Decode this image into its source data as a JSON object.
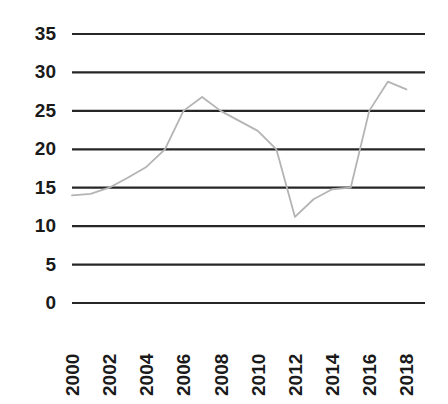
{
  "chart_data": {
    "type": "line",
    "title": "",
    "subtitle": "",
    "xlabel": "",
    "ylabel": "",
    "xlim": [
      2000,
      2019
    ],
    "ylim": [
      0,
      35
    ],
    "grid": "horizontal-only",
    "legend": "none",
    "line_color": "#b4b4b4",
    "grid_color": "#262626",
    "tick_label_color": "#1a1a1a",
    "x": [
      2000,
      2001,
      2002,
      2003,
      2004,
      2005,
      2006,
      2007,
      2008,
      2009,
      2010,
      2011,
      2012,
      2013,
      2014,
      2015,
      2016,
      2017,
      2018
    ],
    "values": [
      14.0,
      14.2,
      15.0,
      16.3,
      17.7,
      20.0,
      25.0,
      26.8,
      25.0,
      23.7,
      22.4,
      20.0,
      11.2,
      13.5,
      14.8,
      15.0,
      25.0,
      28.8,
      27.8
    ],
    "series": [
      {
        "name": "series-1",
        "values": [
          14.0,
          14.2,
          15.0,
          16.3,
          17.7,
          20.0,
          25.0,
          26.8,
          25.0,
          23.7,
          22.4,
          20.0,
          11.2,
          13.5,
          14.8,
          15.0,
          25.0,
          28.8,
          27.8
        ]
      }
    ],
    "yticks": [
      0,
      5,
      10,
      15,
      20,
      25,
      30,
      35
    ],
    "ytick_labels": [
      "0",
      "5",
      "10",
      "15",
      "20",
      "25",
      "30",
      "35"
    ],
    "xticks": [
      2000,
      2002,
      2004,
      2006,
      2008,
      2010,
      2012,
      2014,
      2016,
      2018
    ],
    "xtick_labels": [
      "2000",
      "2002",
      "2004",
      "2006",
      "2008",
      "2010",
      "2012",
      "2014",
      "2016",
      "2018"
    ],
    "xtick_rotation_deg": -90
  }
}
